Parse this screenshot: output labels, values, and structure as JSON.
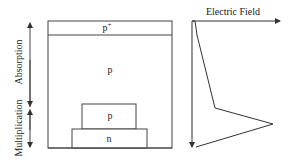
{
  "diagram": {
    "layers": [
      {
        "id": "p_plus",
        "label": "p",
        "superscript": "+"
      },
      {
        "id": "p_absorption",
        "label": "p"
      },
      {
        "id": "p_multiplication",
        "label": "p"
      },
      {
        "id": "n_layer",
        "label": "n"
      }
    ],
    "regions": {
      "absorption": "Absorption",
      "multiplication": "Multiplication"
    },
    "field_axis": {
      "label": "Electric Field"
    },
    "colors": {
      "stroke": "#333333",
      "background": "#ffffff"
    }
  }
}
